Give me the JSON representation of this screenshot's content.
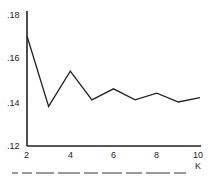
{
  "chart_data": {
    "type": "line",
    "title": "",
    "xlabel": "K",
    "ylabel": "",
    "x": [
      2,
      3,
      4,
      5,
      6,
      7,
      8,
      9,
      10
    ],
    "series": [
      {
        "name": "series-1",
        "values": [
          0.17,
          0.138,
          0.154,
          0.141,
          0.146,
          0.141,
          0.144,
          0.14,
          0.142
        ]
      }
    ],
    "xlim": [
      2,
      10
    ],
    "ylim": [
      0.12,
      0.18
    ],
    "x_ticks": [
      "2",
      "4",
      "6",
      "8",
      "10"
    ],
    "y_ticks": [
      ".12",
      ".14",
      ".16",
      ".18"
    ],
    "grid": false,
    "legend": null,
    "line_color": "#222222"
  },
  "axes": {
    "y_tick_labels": [
      ".18",
      ".16",
      ".14",
      ".12"
    ],
    "x_tick_labels": [
      "2",
      "4",
      "6",
      "8",
      "10"
    ],
    "x_axis_label": "K"
  }
}
